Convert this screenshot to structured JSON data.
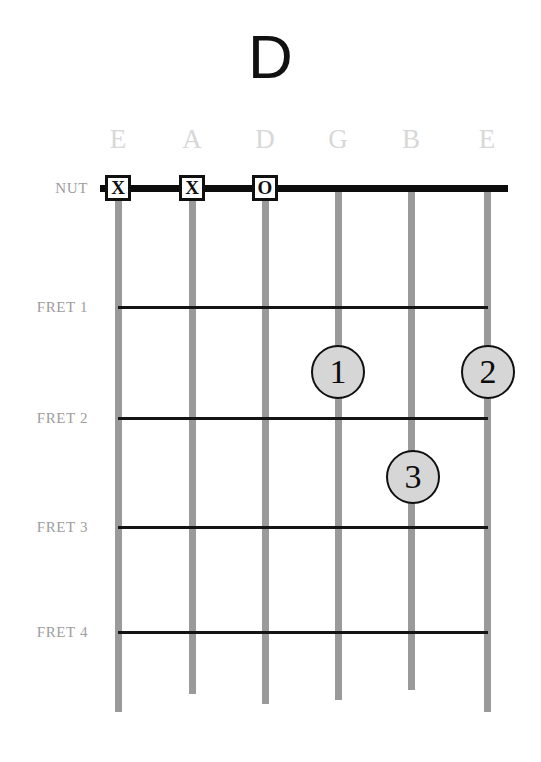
{
  "chord": {
    "name": "D",
    "instrument": "guitar"
  },
  "labels": {
    "nut": "NUT",
    "frets": [
      "FRET 1",
      "FRET 2",
      "FRET 3",
      "FRET 4"
    ]
  },
  "strings": [
    {
      "name": "E",
      "number": 6
    },
    {
      "name": "A",
      "number": 5
    },
    {
      "name": "D",
      "number": 4
    },
    {
      "name": "G",
      "number": 3
    },
    {
      "name": "B",
      "number": 2
    },
    {
      "name": "E",
      "number": 1
    }
  ],
  "nut_markers": [
    {
      "string": "E",
      "symbol": "X",
      "meaning": "muted"
    },
    {
      "string": "A",
      "symbol": "X",
      "meaning": "muted"
    },
    {
      "string": "D",
      "symbol": "O",
      "meaning": "open"
    }
  ],
  "finger_positions": [
    {
      "finger": "1",
      "string": "G",
      "fret": 2
    },
    {
      "finger": "2",
      "string": "E",
      "fret": 2
    },
    {
      "finger": "3",
      "string": "B",
      "fret": 3
    }
  ],
  "colors": {
    "title": "#111111",
    "string": "#9a9a9a",
    "string_label": "#d8d8d8",
    "row_label": "#9d9d9d",
    "fret_line": "#141414",
    "nut_bar": "#0d0d0d",
    "dot_fill": "#d6d6d6",
    "dot_stroke": "#101010",
    "background": "#ffffff"
  },
  "geometry": {
    "string_x": [
      118,
      192,
      265,
      338,
      411,
      487
    ],
    "string_top": 190,
    "string_bottoms": [
      712,
      694,
      704,
      700,
      690,
      712
    ],
    "nut_y": 188,
    "fret_y": [
      307,
      418,
      527,
      632
    ],
    "dot_xy": [
      [
        338,
        372
      ],
      [
        488,
        372
      ],
      [
        413,
        477
      ]
    ]
  }
}
